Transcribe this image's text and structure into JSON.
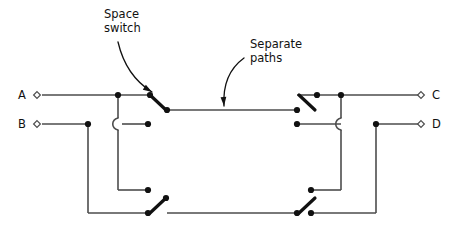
{
  "figure": {
    "type": "circuit-diagram",
    "background_color": "#ffffff",
    "wire_color": "#4d4d4d",
    "node_color": "#111111",
    "blade_color": "#111111",
    "text_color": "#111111",
    "width": 455,
    "height": 231
  },
  "annotations": [
    {
      "id": "space-switch",
      "line1": "Space",
      "line2": "switch",
      "text_x": 104,
      "text_y": 18,
      "arrow_from_x": 118,
      "arrow_from_y": 42,
      "arrow_to_x": 152,
      "arrow_to_y": 92,
      "arrow_curve_x": 126,
      "arrow_curve_y": 76
    },
    {
      "id": "separate-paths",
      "line1": "Separate",
      "line2": "paths",
      "text_x": 250,
      "text_y": 48,
      "arrow_from_x": 244,
      "arrow_from_y": 58,
      "arrow_to_x": 224,
      "arrow_to_y": 106,
      "arrow_curve_x": 222,
      "arrow_curve_y": 74
    }
  ],
  "ports": [
    {
      "id": "A",
      "label": "A",
      "side": "left",
      "label_x": 18,
      "label_y": 99,
      "marker_x": 37,
      "marker_y": 95
    },
    {
      "id": "B",
      "label": "B",
      "side": "left",
      "label_x": 18,
      "label_y": 128,
      "marker_x": 37,
      "marker_y": 124
    },
    {
      "id": "C",
      "label": "C",
      "side": "right",
      "label_x": 432,
      "label_y": 99,
      "marker_x": 421,
      "marker_y": 95
    },
    {
      "id": "D",
      "label": "D",
      "side": "right",
      "label_x": 432,
      "label_y": 128,
      "marker_x": 421,
      "marker_y": 124
    }
  ],
  "wires": [
    {
      "id": "a-input-run",
      "points": "42,95 148,95"
    },
    {
      "id": "b-input-run",
      "points": "42,124 88,124"
    },
    {
      "id": "b-right-run",
      "points": "122,124 148,124"
    },
    {
      "id": "a-drop-upper",
      "points": "118,95 118,118"
    },
    {
      "id": "a-drop-lower",
      "points": "118,130 118,190"
    },
    {
      "id": "a-drop-foot",
      "points": "118,190 148,190"
    },
    {
      "id": "b-drop",
      "points": "88,124 88,213"
    },
    {
      "id": "b-drop-foot",
      "points": "88,213 148,213"
    },
    {
      "id": "upper-middle-path",
      "points": "167,110 297,110"
    },
    {
      "id": "lower-middle-path",
      "points": "167,213 297,213"
    },
    {
      "id": "c-output-run",
      "points": "317,95 418,95"
    },
    {
      "id": "c-left-run",
      "points": "297,95 317,95"
    },
    {
      "id": "d-output-run",
      "points": "376,124 418,124"
    },
    {
      "id": "d-left-run",
      "points": "297,124 341,124"
    },
    {
      "id": "c-drop-upper",
      "points": "341,95 341,118"
    },
    {
      "id": "c-drop-lower",
      "points": "341,130 341,190"
    },
    {
      "id": "c-drop-foot",
      "points": "311,190 341,190"
    },
    {
      "id": "d-drop",
      "points": "376,124 376,213"
    },
    {
      "id": "d-drop-foot",
      "points": "311,213 376,213"
    }
  ],
  "hops": [
    {
      "id": "left-wire-hop",
      "path": "M118,118 C111,120 111,128 118,130"
    },
    {
      "id": "right-wire-hop",
      "path": "M341,118 C334,120 334,128 341,130"
    }
  ],
  "switch_blades": [
    {
      "id": "upper-left-blade",
      "x1": 150,
      "y1": 95,
      "x2": 166,
      "y2": 110
    },
    {
      "id": "lower-left-blade",
      "x1": 150,
      "y1": 213,
      "x2": 166,
      "y2": 198
    },
    {
      "id": "upper-right-blade",
      "x1": 299,
      "y1": 95,
      "x2": 315,
      "y2": 110
    },
    {
      "id": "lower-right-blade",
      "x1": 299,
      "y1": 213,
      "x2": 315,
      "y2": 198
    }
  ],
  "nodes": [
    {
      "id": "node-a-junction",
      "x": 118,
      "y": 95
    },
    {
      "id": "node-a-switch-pole",
      "x": 150,
      "y": 95
    },
    {
      "id": "node-b-junction",
      "x": 88,
      "y": 124
    },
    {
      "id": "node-b-contact",
      "x": 148,
      "y": 124
    },
    {
      "id": "node-upper-left-throw",
      "x": 167,
      "y": 110
    },
    {
      "id": "node-a-lower-contact",
      "x": 148,
      "y": 190
    },
    {
      "id": "node-b-lower-pole",
      "x": 148,
      "y": 213
    },
    {
      "id": "node-lower-left-throw",
      "x": 166,
      "y": 198
    },
    {
      "id": "node-upper-right-throw",
      "x": 297,
      "y": 110
    },
    {
      "id": "node-lower-right-throw",
      "x": 297,
      "y": 213
    },
    {
      "id": "node-c-pole",
      "x": 317,
      "y": 95
    },
    {
      "id": "node-c-junction",
      "x": 341,
      "y": 95
    },
    {
      "id": "node-d-contact",
      "x": 297,
      "y": 124
    },
    {
      "id": "node-d-junction",
      "x": 376,
      "y": 124
    },
    {
      "id": "node-c-lower-contact",
      "x": 311,
      "y": 190
    },
    {
      "id": "node-d-lower-pole",
      "x": 311,
      "y": 213
    }
  ]
}
